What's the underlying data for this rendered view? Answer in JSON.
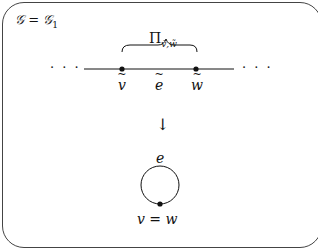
{
  "diagram": {
    "title": {
      "base": "𝒢 = 𝒢",
      "subscript": "1"
    },
    "top_graph": {
      "brace_label": {
        "base": "Π",
        "subscript": "ṽ,w̃"
      },
      "left_ellipsis": "· · ·",
      "right_ellipsis": "· · ·",
      "vertices": [
        {
          "label": "v",
          "tilde": true
        },
        {
          "label": "w",
          "tilde": true
        }
      ],
      "edge": {
        "label": "e",
        "tilde": true
      }
    },
    "map_arrow": "↓",
    "bottom_graph": {
      "edge_label": "e",
      "vertex_label": "v = w",
      "type": "loop"
    },
    "colors": {
      "line": "#111111",
      "frame": "#444444",
      "background": "#ffffff"
    }
  }
}
